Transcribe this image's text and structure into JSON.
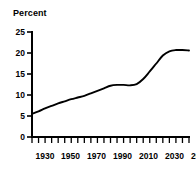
{
  "chart_data": {
    "type": "line",
    "title": "Percent",
    "xlabel": "",
    "ylabel": "",
    "ylim": [
      0,
      25
    ],
    "xlim": [
      1930,
      2050
    ],
    "grid": false,
    "legend": "none",
    "y_ticks": [
      0,
      5,
      10,
      15,
      20,
      25
    ],
    "y_tick_labels": [
      "0",
      "5",
      "10",
      "15",
      "20",
      "25"
    ],
    "x_ticks": [
      1930,
      1950,
      1970,
      1990,
      2010,
      2030,
      2050
    ],
    "x_tick_labels": [
      "1930",
      "1950",
      "1970",
      "1990",
      "2010",
      "2030",
      "2050"
    ],
    "x_minor_tick_interval": 5,
    "series": [
      {
        "name": "Percent",
        "x": [
          1930,
          1935,
          1940,
          1945,
          1950,
          1955,
          1960,
          1965,
          1970,
          1975,
          1980,
          1985,
          1990,
          1995,
          2000,
          2005,
          2010,
          2015,
          2020,
          2025,
          2030,
          2035,
          2040,
          2045,
          2050
        ],
        "values": [
          5.5,
          6.1,
          6.8,
          7.4,
          8.0,
          8.5,
          9.0,
          9.4,
          9.8,
          10.4,
          11.0,
          11.6,
          12.2,
          12.4,
          12.4,
          12.3,
          12.6,
          13.8,
          15.6,
          17.5,
          19.4,
          20.4,
          20.7,
          20.7,
          20.6
        ]
      }
    ],
    "annotations": []
  },
  "colors": {
    "line": "#000000",
    "axis": "#000000",
    "background": "#ffffff",
    "text": "#000000"
  }
}
